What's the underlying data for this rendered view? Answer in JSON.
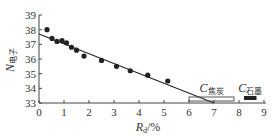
{
  "chart_data": {
    "type": "scatter",
    "title": "",
    "xlabel": "R_d/%",
    "xlabel_main": "R",
    "xlabel_sub": "d",
    "xlabel_unit": "/%",
    "ylabel": "N_电子",
    "ylabel_main": "N",
    "ylabel_sub": "电子",
    "xlim": [
      0,
      9
    ],
    "ylim": [
      33,
      39
    ],
    "xticks": [
      "0",
      "1",
      "2",
      "3",
      "4",
      "5",
      "6",
      "7",
      "8",
      "9"
    ],
    "yticks": [
      "33",
      "34",
      "35",
      "36",
      "37",
      "38",
      "39"
    ],
    "grid": false,
    "series": [
      {
        "name": "measured",
        "kind": "scatter",
        "x": [
          0.32,
          0.52,
          0.72,
          0.92,
          1.1,
          1.3,
          1.5,
          1.8,
          2.5,
          3.1,
          3.65,
          4.35,
          5.15
        ],
        "y": [
          38.0,
          37.4,
          37.2,
          37.25,
          37.1,
          36.8,
          36.6,
          36.2,
          35.9,
          35.5,
          35.2,
          34.9,
          34.5
        ]
      },
      {
        "name": "linear fit",
        "kind": "line",
        "x": [
          0,
          7.0
        ],
        "y": [
          37.7,
          33.0
        ]
      }
    ],
    "annotations": [
      {
        "label_main": "C",
        "label_sub": "焦炭",
        "range": [
          6.0,
          7.8
        ],
        "style": "open-bar"
      },
      {
        "label_main": "C",
        "label_sub": "石墨",
        "range": [
          8.2,
          8.7
        ],
        "style": "filled-bar"
      }
    ],
    "colors": {
      "ink": "#222222",
      "axis": "#444444"
    }
  }
}
